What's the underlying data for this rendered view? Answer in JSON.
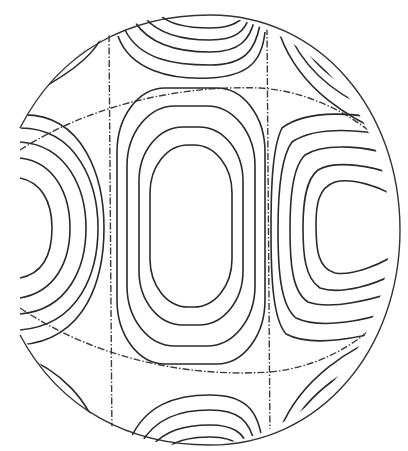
{
  "figure": {
    "colors": {
      "line": "#2a2a2a",
      "background": "#ffffff"
    },
    "nodal_lines": {
      "meridians": 2,
      "latitude_arcs": 2,
      "style": "dash-dot"
    },
    "regions": [
      {
        "name": "center-lobe",
        "contour_count": 4
      },
      {
        "name": "right-lobe",
        "contour_count": 5
      },
      {
        "name": "left-lobe",
        "contour_count": 5
      },
      {
        "name": "top-center-lobe",
        "contour_count": 5
      },
      {
        "name": "bottom-center-lobe",
        "contour_count": 4
      }
    ]
  }
}
